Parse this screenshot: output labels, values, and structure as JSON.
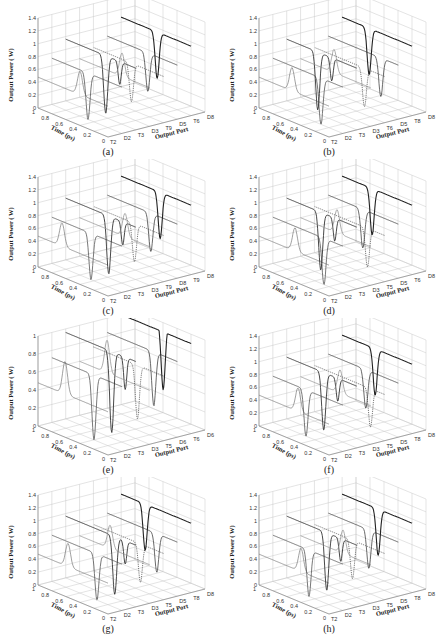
{
  "figure": {
    "panels": [
      {
        "id": "a",
        "caption": "(a)",
        "zmax": "1.4"
      },
      {
        "id": "b",
        "caption": "(b)",
        "zmax": "1.4"
      },
      {
        "id": "c",
        "caption": "(c)",
        "zmax": "1.4"
      },
      {
        "id": "d",
        "caption": "(d)",
        "zmax": "1.4"
      },
      {
        "id": "e",
        "caption": "(e)",
        "zmax": "1"
      },
      {
        "id": "f",
        "caption": "(f)",
        "zmax": "1.4"
      },
      {
        "id": "g",
        "caption": "(g)",
        "zmax": "1.4"
      },
      {
        "id": "h",
        "caption": "(h)",
        "zmax": "1.4"
      }
    ]
  },
  "chart_data": [
    {
      "type": "line",
      "title": "(a)",
      "xlabel": "Output Port",
      "ylabel": "Time (ps)",
      "zlabel": "Output Power ( W)",
      "x_ticks": [
        "T2",
        "D2",
        "T3",
        "D3",
        "T9",
        "D5",
        "T6",
        "D8"
      ],
      "y_ticks": [
        "0",
        "0.2",
        "0.4",
        "0.6",
        "0.8",
        "1"
      ],
      "z_ticks": [
        "0",
        "0.2",
        "0.4",
        "0.6",
        "0.8",
        "1",
        "1.2",
        "1.4"
      ],
      "zlim": [
        0,
        1.4
      ]
    },
    {
      "type": "line",
      "title": "(b)",
      "xlabel": "Output Port",
      "ylabel": "Time (ps)",
      "zlabel": "Output Power ( W)",
      "x_ticks": [
        "T2",
        "D2",
        "T3",
        "D3",
        "T6",
        "D5",
        "T8",
        "D8"
      ],
      "y_ticks": [
        "0",
        "0.2",
        "0.4",
        "0.6",
        "0.8",
        "1"
      ],
      "z_ticks": [
        "0",
        "0.2",
        "0.4",
        "0.6",
        "0.8",
        "1",
        "1.2",
        "1.4"
      ],
      "zlim": [
        0,
        1.4
      ]
    },
    {
      "type": "line",
      "title": "(c)",
      "xlabel": "Output Port",
      "ylabel": "Time (ps)",
      "zlabel": "Output Power ( W)",
      "x_ticks": [
        "T2",
        "D2",
        "T3",
        "D3",
        "T9",
        "D8",
        "T9",
        "D8"
      ],
      "y_ticks": [
        "0",
        "0.2",
        "0.4",
        "0.6",
        "0.8",
        "1"
      ],
      "z_ticks": [
        "0",
        "0.2",
        "0.4",
        "0.6",
        "0.8",
        "1",
        "1.2",
        "1.4"
      ],
      "zlim": [
        0,
        1.4
      ]
    },
    {
      "type": "line",
      "title": "(d)",
      "xlabel": "Output Port",
      "ylabel": "Time (ps)",
      "zlabel": "Output Power ( W)",
      "x_ticks": [
        "T2",
        "D2",
        "T3",
        "D3",
        "T5",
        "D5",
        "T6",
        "D8"
      ],
      "y_ticks": [
        "0",
        "0.2",
        "0.4",
        "0.6",
        "0.8",
        "1"
      ],
      "z_ticks": [
        "0",
        "0.2",
        "0.4",
        "0.6",
        "0.8",
        "1",
        "1.2",
        "1.4"
      ],
      "zlim": [
        0,
        1.4
      ]
    },
    {
      "type": "line",
      "title": "(e)",
      "xlabel": "Output Port",
      "ylabel": "Time (ps)",
      "zlabel": "Output Power ( W)",
      "x_ticks": [
        "T2",
        "D2",
        "T3",
        "D3",
        "T5",
        "D6",
        "T6",
        "D6"
      ],
      "y_ticks": [
        "0",
        "0.2",
        "0.4",
        "0.6",
        "0.8",
        "1"
      ],
      "z_ticks": [
        "0",
        "0.2",
        "0.4",
        "0.6",
        "0.8",
        "1"
      ],
      "zlim": [
        0,
        1
      ]
    },
    {
      "type": "line",
      "title": "(f)",
      "xlabel": "Output Port",
      "ylabel": "Time (ps)",
      "zlabel": "Output Power ( W)",
      "x_ticks": [
        "T2",
        "D2",
        "T3",
        "D3",
        "T5",
        "D5",
        "T8",
        "D8"
      ],
      "y_ticks": [
        "0",
        "0.2",
        "0.4",
        "0.6",
        "0.8",
        "1"
      ],
      "z_ticks": [
        "0",
        "0.2",
        "0.4",
        "0.6",
        "0.8",
        "1",
        "1.2",
        "1.4"
      ],
      "zlim": [
        0,
        1.4
      ]
    },
    {
      "type": "line",
      "title": "(g)",
      "xlabel": "Output Port",
      "ylabel": "Time (ps)",
      "zlabel": "Output Power ( W)",
      "x_ticks": [
        "T2",
        "D2",
        "T3",
        "D3",
        "T5",
        "D5",
        "T8",
        "D8"
      ],
      "y_ticks": [
        "0",
        "0.2",
        "0.4",
        "0.6",
        "0.8",
        "1"
      ],
      "z_ticks": [
        "0",
        "0.2",
        "0.4",
        "0.6",
        "0.8",
        "1",
        "1.2",
        "1.4"
      ],
      "zlim": [
        0,
        1.4
      ]
    },
    {
      "type": "line",
      "title": "(h)",
      "xlabel": "Output Port",
      "ylabel": "Time (ps)",
      "zlabel": "Output Power ( W)",
      "x_ticks": [
        "T2",
        "D2",
        "T3",
        "D3",
        "T5",
        "D5",
        "T8",
        "D8"
      ],
      "y_ticks": [
        "0",
        "0.2",
        "0.4",
        "0.6",
        "0.8",
        "1"
      ],
      "z_ticks": [
        "0",
        "0.2",
        "0.4",
        "0.6",
        "0.8",
        "1",
        "1.2",
        "1.4"
      ],
      "zlim": [
        0,
        1.4
      ]
    }
  ]
}
